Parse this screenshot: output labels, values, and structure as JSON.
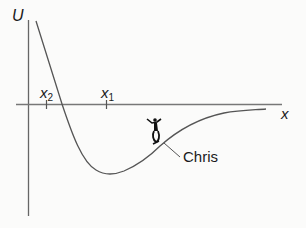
{
  "diagram": {
    "y_axis_label": "U",
    "x_axis_label": "x",
    "ticks": [
      {
        "name": "x",
        "sub": "2"
      },
      {
        "name": "x",
        "sub": "1"
      }
    ],
    "object_label": "Chris",
    "object_icon": "skateboarder-icon",
    "colors": {
      "line": "#555555",
      "text": "#1a1a1a",
      "background": "#fbfbfa"
    }
  }
}
